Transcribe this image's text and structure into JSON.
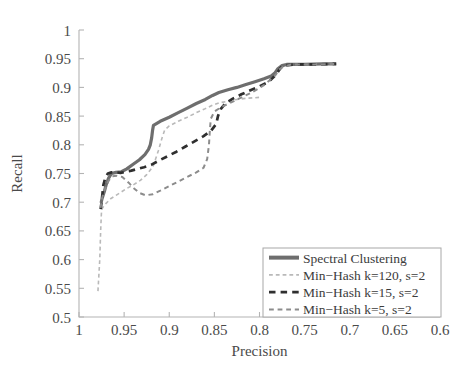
{
  "chart_data": {
    "type": "line",
    "title": "",
    "subtitle": "",
    "xlabel": "Precision",
    "ylabel": "Recall",
    "xlim": [
      1.0,
      0.6
    ],
    "ylim": [
      0.5,
      1.0
    ],
    "x_reversed": true,
    "grid": false,
    "legend_position": "bottom-right",
    "xticks": [
      1,
      0.95,
      0.9,
      0.85,
      0.8,
      0.75,
      0.7,
      0.65,
      0.6
    ],
    "xtick_labels": [
      "1",
      "0.95",
      "0.9",
      "0.85",
      "0.8",
      "0.75",
      "0.7",
      "0.65",
      "0.6"
    ],
    "yticks": [
      0.5,
      0.55,
      0.6,
      0.65,
      0.7,
      0.75,
      0.8,
      0.85,
      0.9,
      0.95,
      1
    ],
    "ytick_labels": [
      "0.5",
      "0.55",
      "0.6",
      "0.65",
      "0.7",
      "0.75",
      "0.8",
      "0.85",
      "0.9",
      "0.95",
      "1"
    ],
    "series": [
      {
        "name": "Spectral Clustering",
        "color": "#6e6e6e",
        "style": "solid",
        "width": 3.2,
        "points": [
          [
            0.9755,
            0.699
          ],
          [
            0.9745,
            0.706
          ],
          [
            0.972,
            0.718
          ],
          [
            0.97,
            0.73
          ],
          [
            0.9672,
            0.742
          ],
          [
            0.964,
            0.75
          ],
          [
            0.959,
            0.752
          ],
          [
            0.953,
            0.753
          ],
          [
            0.947,
            0.758
          ],
          [
            0.94,
            0.766
          ],
          [
            0.933,
            0.774
          ],
          [
            0.927,
            0.783
          ],
          [
            0.923,
            0.792
          ],
          [
            0.921,
            0.8
          ],
          [
            0.9195,
            0.812
          ],
          [
            0.9185,
            0.825
          ],
          [
            0.9175,
            0.834
          ],
          [
            0.91,
            0.841
          ],
          [
            0.9,
            0.848
          ],
          [
            0.89,
            0.856
          ],
          [
            0.88,
            0.864
          ],
          [
            0.87,
            0.872
          ],
          [
            0.86,
            0.879
          ],
          [
            0.852,
            0.886
          ],
          [
            0.845,
            0.891
          ],
          [
            0.835,
            0.896
          ],
          [
            0.825,
            0.9
          ],
          [
            0.815,
            0.905
          ],
          [
            0.805,
            0.91
          ],
          [
            0.795,
            0.915
          ],
          [
            0.787,
            0.92
          ],
          [
            0.783,
            0.925
          ],
          [
            0.78,
            0.932
          ],
          [
            0.775,
            0.938
          ],
          [
            0.77,
            0.94
          ],
          [
            0.75,
            0.94
          ],
          [
            0.73,
            0.941
          ],
          [
            0.715,
            0.941
          ]
        ]
      },
      {
        "name": "Min-Hash k=120, s=2",
        "color": "#b9b9b9",
        "style": "dashed",
        "width": 1.6,
        "points": [
          [
            0.979,
            0.545
          ],
          [
            0.977,
            0.6
          ],
          [
            0.976,
            0.65
          ],
          [
            0.9752,
            0.68
          ],
          [
            0.974,
            0.69
          ],
          [
            0.97,
            0.698
          ],
          [
            0.965,
            0.706
          ],
          [
            0.959,
            0.712
          ],
          [
            0.953,
            0.718
          ],
          [
            0.947,
            0.724
          ],
          [
            0.94,
            0.73
          ],
          [
            0.932,
            0.738
          ],
          [
            0.925,
            0.748
          ],
          [
            0.918,
            0.762
          ],
          [
            0.912,
            0.79
          ],
          [
            0.908,
            0.812
          ],
          [
            0.905,
            0.826
          ],
          [
            0.9,
            0.833
          ],
          [
            0.89,
            0.841
          ],
          [
            0.88,
            0.848
          ],
          [
            0.87,
            0.856
          ],
          [
            0.86,
            0.863
          ],
          [
            0.852,
            0.869
          ],
          [
            0.845,
            0.873
          ],
          [
            0.835,
            0.876
          ],
          [
            0.825,
            0.879
          ],
          [
            0.815,
            0.881
          ],
          [
            0.805,
            0.882
          ],
          [
            0.798,
            0.883
          ]
        ]
      },
      {
        "name": "Min-Hash k=15, s=2",
        "color": "#2f2f2f",
        "style": "dashed",
        "width": 2.7,
        "points": [
          [
            0.976,
            0.688
          ],
          [
            0.975,
            0.7
          ],
          [
            0.974,
            0.715
          ],
          [
            0.973,
            0.73
          ],
          [
            0.971,
            0.742
          ],
          [
            0.968,
            0.75
          ],
          [
            0.964,
            0.752
          ],
          [
            0.959,
            0.752
          ],
          [
            0.954,
            0.751
          ],
          [
            0.948,
            0.753
          ],
          [
            0.942,
            0.755
          ],
          [
            0.935,
            0.758
          ],
          [
            0.928,
            0.761
          ],
          [
            0.92,
            0.765
          ],
          [
            0.912,
            0.772
          ],
          [
            0.902,
            0.78
          ],
          [
            0.892,
            0.788
          ],
          [
            0.882,
            0.797
          ],
          [
            0.872,
            0.806
          ],
          [
            0.862,
            0.815
          ],
          [
            0.854,
            0.824
          ],
          [
            0.848,
            0.836
          ],
          [
            0.846,
            0.85
          ],
          [
            0.843,
            0.862
          ],
          [
            0.838,
            0.872
          ],
          [
            0.83,
            0.88
          ],
          [
            0.82,
            0.888
          ],
          [
            0.81,
            0.895
          ],
          [
            0.8,
            0.902
          ],
          [
            0.792,
            0.908
          ],
          [
            0.787,
            0.914
          ],
          [
            0.783,
            0.92
          ],
          [
            0.78,
            0.926
          ],
          [
            0.777,
            0.933
          ],
          [
            0.774,
            0.938
          ],
          [
            0.76,
            0.94
          ],
          [
            0.74,
            0.94
          ],
          [
            0.715,
            0.941
          ]
        ]
      },
      {
        "name": "Min-Hash k=5, s=2",
        "color": "#8c8c8c",
        "style": "dashed",
        "width": 2.0,
        "points": [
          [
            0.976,
            0.69
          ],
          [
            0.975,
            0.703
          ],
          [
            0.973,
            0.716
          ],
          [
            0.97,
            0.728
          ],
          [
            0.967,
            0.738
          ],
          [
            0.963,
            0.745
          ],
          [
            0.958,
            0.746
          ],
          [
            0.952,
            0.744
          ],
          [
            0.945,
            0.734
          ],
          [
            0.939,
            0.724
          ],
          [
            0.933,
            0.716
          ],
          [
            0.926,
            0.712
          ],
          [
            0.918,
            0.714
          ],
          [
            0.91,
            0.72
          ],
          [
            0.9,
            0.728
          ],
          [
            0.89,
            0.736
          ],
          [
            0.88,
            0.744
          ],
          [
            0.87,
            0.752
          ],
          [
            0.862,
            0.76
          ],
          [
            0.858,
            0.775
          ],
          [
            0.856,
            0.8
          ],
          [
            0.855,
            0.825
          ],
          [
            0.854,
            0.845
          ],
          [
            0.85,
            0.858
          ],
          [
            0.842,
            0.866
          ],
          [
            0.834,
            0.872
          ],
          [
            0.826,
            0.878
          ],
          [
            0.818,
            0.884
          ],
          [
            0.81,
            0.89
          ],
          [
            0.802,
            0.897
          ],
          [
            0.795,
            0.904
          ],
          [
            0.789,
            0.912
          ],
          [
            0.785,
            0.918
          ],
          [
            0.782,
            0.922
          ],
          [
            0.779,
            0.93
          ],
          [
            0.774,
            0.936
          ],
          [
            0.765,
            0.94
          ],
          [
            0.74,
            0.94
          ],
          [
            0.715,
            0.941
          ]
        ]
      }
    ],
    "legend_entries": [
      {
        "label": "Spectral Clustering",
        "color": "#6e6e6e",
        "style": "solid",
        "width": 4
      },
      {
        "label": "Min−Hash k=120, s=2",
        "color": "#b9b9b9",
        "style": "dashed",
        "width": 1.6
      },
      {
        "label": "Min−Hash k=15, s=2",
        "color": "#2f2f2f",
        "style": "dashed",
        "width": 2.7
      },
      {
        "label": "Min−Hash k=5, s=2",
        "color": "#8c8c8c",
        "style": "dashed",
        "width": 2
      }
    ]
  },
  "plot_geometry": {
    "left": 79,
    "right": 440,
    "top": 30,
    "bottom": 317
  },
  "legend_geometry": {
    "x": 263,
    "y": 248,
    "width": 178,
    "height": 69
  }
}
